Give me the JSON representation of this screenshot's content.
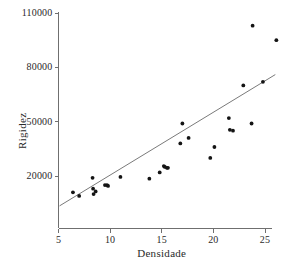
{
  "chart_data": {
    "type": "scatter",
    "title": "",
    "xlabel": "Densidade",
    "ylabel": "Rigidez",
    "xlim": [
      5,
      26.8
    ],
    "ylim": [
      2000,
      112000
    ],
    "xticks": [
      5,
      10,
      15,
      20,
      25
    ],
    "xticklabels": [
      "5",
      "10",
      "15",
      "20",
      "25"
    ],
    "yticks": [
      20000,
      50000,
      80000,
      110000
    ],
    "yticklabels": [
      "20000",
      "50000",
      "80000",
      "110000"
    ],
    "grid": false,
    "legend": null,
    "marker": "filled-circle",
    "marker_color": "#141414",
    "line_color": "#7a7a7a",
    "axis_color": "#6f6f6f",
    "points": [
      {
        "x": 6.4,
        "y": 11000
      },
      {
        "x": 7.0,
        "y": 9000
      },
      {
        "x": 8.3,
        "y": 19000
      },
      {
        "x": 8.35,
        "y": 13000
      },
      {
        "x": 8.4,
        "y": 10000
      },
      {
        "x": 8.6,
        "y": 11500
      },
      {
        "x": 9.5,
        "y": 15000
      },
      {
        "x": 9.7,
        "y": 15000
      },
      {
        "x": 9.8,
        "y": 14500
      },
      {
        "x": 11.0,
        "y": 19500
      },
      {
        "x": 13.8,
        "y": 18500
      },
      {
        "x": 14.8,
        "y": 22000
      },
      {
        "x": 15.2,
        "y": 25500
      },
      {
        "x": 15.3,
        "y": 25000
      },
      {
        "x": 15.5,
        "y": 24500
      },
      {
        "x": 15.6,
        "y": 24500
      },
      {
        "x": 16.8,
        "y": 38000
      },
      {
        "x": 17.0,
        "y": 49000
      },
      {
        "x": 17.6,
        "y": 41000
      },
      {
        "x": 19.7,
        "y": 30000
      },
      {
        "x": 20.1,
        "y": 36000
      },
      {
        "x": 21.5,
        "y": 52000
      },
      {
        "x": 21.6,
        "y": 45500
      },
      {
        "x": 21.9,
        "y": 45000
      },
      {
        "x": 22.9,
        "y": 70000
      },
      {
        "x": 23.7,
        "y": 49000
      },
      {
        "x": 23.8,
        "y": 103000
      },
      {
        "x": 24.8,
        "y": 72000
      },
      {
        "x": 26.1,
        "y": 95000
      }
    ],
    "fit_line": {
      "x": [
        5.1,
        26.0
      ],
      "y": [
        3500,
        76000
      ]
    }
  }
}
